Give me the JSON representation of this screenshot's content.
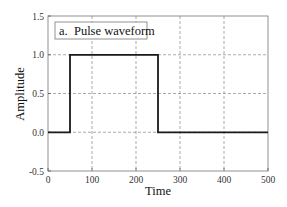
{
  "chart_data": {
    "type": "line",
    "title": "",
    "legend": {
      "label": "a.  Pulse waveform",
      "position": "upper-left"
    },
    "xlabel": "Time",
    "ylabel": "Amplitude",
    "xlim": [
      0,
      500
    ],
    "ylim": [
      -0.5,
      1.5
    ],
    "xticks": [
      0,
      100,
      200,
      300,
      400,
      500
    ],
    "xtick_labels": [
      "0",
      "100",
      "200",
      "300",
      "400",
      "500"
    ],
    "yticks": [
      -0.5,
      0.0,
      0.5,
      1.0,
      1.5
    ],
    "ytick_labels": [
      "-0.5",
      "0.0",
      "0.5",
      "1.0",
      "1.5"
    ],
    "grid": true,
    "series": [
      {
        "name": "Pulse waveform",
        "x": [
          0,
          50,
          50,
          250,
          250,
          500
        ],
        "y": [
          0,
          0,
          1,
          1,
          0,
          0
        ],
        "color": "#1a1a1a"
      }
    ]
  },
  "colors": {
    "line": "#1a1a1a",
    "grid": "#888888",
    "axis": "#555555"
  }
}
